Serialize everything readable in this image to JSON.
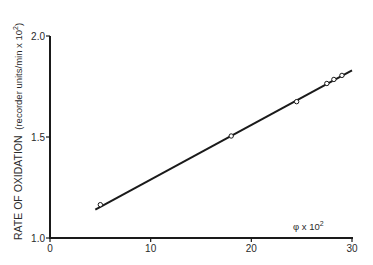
{
  "chart_data": {
    "type": "scatter",
    "title": "",
    "xlabel": "φ x 10²",
    "ylabel": "RATE OF OXIDATION (recorder units/min x 10²)",
    "xlim": [
      0,
      30
    ],
    "ylim": [
      1.0,
      2.0
    ],
    "x_ticks": [
      "0",
      "10",
      "20",
      "30"
    ],
    "y_ticks": [
      "1.0",
      "1.5",
      "2.0"
    ],
    "grid": false,
    "legend": null,
    "series": [
      {
        "name": "observed",
        "marker": "open-circle",
        "x": [
          5.0,
          18.0,
          24.5,
          27.5,
          28.2,
          29.0
        ],
        "y": [
          1.16,
          1.5,
          1.67,
          1.76,
          1.78,
          1.8
        ]
      }
    ],
    "fit_line": {
      "x": [
        4.5,
        30.0
      ],
      "y": [
        1.14,
        1.83
      ]
    }
  },
  "labels": {
    "ylabel_main": "RATE OF OXIDATION",
    "ylabel_units": "(recorder units/min x 10",
    "ylabel_sup": "2",
    "ylabel_close": ")",
    "xlabel_main": "φ x 10",
    "xlabel_sup": "2"
  }
}
